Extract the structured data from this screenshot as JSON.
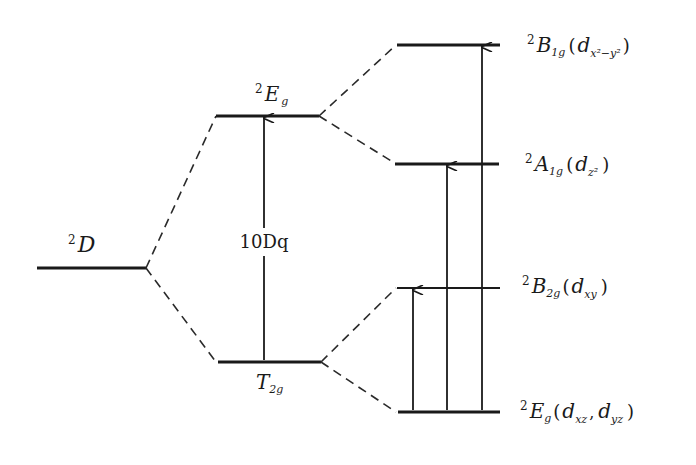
{
  "diagram": {
    "type": "crystal-field-energy-level-diagram",
    "free_ion": {
      "sup": "2",
      "term": "D"
    },
    "octahedral": {
      "upper": {
        "sup": "2",
        "term": "E",
        "sub": "g"
      },
      "lower": {
        "term": "T",
        "sub": "2g"
      },
      "splitting_label": "10Dq"
    },
    "distorted": {
      "levels": [
        {
          "sup": "2",
          "term": "B",
          "sub": "1g",
          "orbital": "d",
          "orbital_sub": "x²−y²",
          "open": "(",
          "close": ")"
        },
        {
          "sup": "2",
          "term": "A",
          "sub": "1g",
          "orbital": "d",
          "orbital_sub": "z²",
          "open": "(",
          "close": ")"
        },
        {
          "sup": "2",
          "term": "B",
          "sub": "2g",
          "orbital": "d",
          "orbital_sub": "xy",
          "open": "(",
          "close": ")"
        },
        {
          "sup": "2",
          "term": "E",
          "sub": "g",
          "orbital": "d",
          "orbital_sub": "xz",
          "separator": ",",
          "orbital2": "d",
          "orbital2_sub": "yz",
          "open": "(",
          "close": ")"
        }
      ]
    },
    "colors": {
      "ink": "#1a1a1a",
      "background": "#ffffff"
    }
  }
}
